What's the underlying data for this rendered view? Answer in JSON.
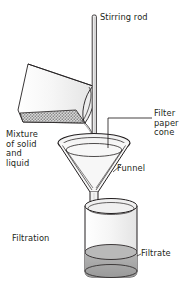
{
  "figure": {
    "title": "Filtration",
    "caption": "Filtration",
    "background_color": "#ffffff",
    "stroke_color": "#231f20",
    "glass_fill": "#f2f2f2",
    "liquid_color": "#a8a8a8",
    "mixture_color": "#8c8c8c",
    "width": 183,
    "height": 281
  },
  "labels": {
    "stirring_rod": "Stirring rod",
    "filter_paper_cone": "Filter\npaper\ncone",
    "filter_paper_cone_lines": [
      "Filter",
      "paper",
      "cone"
    ],
    "mixture": "Mixture\nof solid\nand\nliquid",
    "mixture_lines": [
      "Mixture",
      "of solid",
      "and",
      "liquid"
    ],
    "funnel": "Funnel",
    "filtration": "Filtration",
    "filtrate": "Filtrate"
  },
  "parts": {
    "stirring_rod": "stirring-rod",
    "pouring_beaker": "pouring-beaker",
    "mixture_contents": "mixture-of-solid-and-liquid",
    "filter_paper_cone": "filter-paper-cone",
    "funnel": "funnel",
    "receiving_beaker": "receiving-beaker",
    "filtrate_liquid": "filtrate-liquid"
  }
}
